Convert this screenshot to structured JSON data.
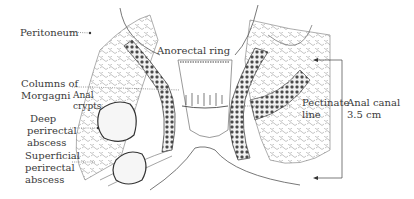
{
  "diagram": {
    "colors": {
      "ink": "#3a3a3a",
      "tissue_dark": "#4a4a4a",
      "fat_lobules": "#8a8a8a",
      "background": "#ffffff"
    },
    "labels": {
      "peritoneum": "Peritoneum",
      "anorectal_ring": "Anorectal ring",
      "columns_line1": "Columns of",
      "columns_line2": "Morgagni",
      "anal_crypts_line1": "Anal",
      "anal_crypts_line2": "crypts",
      "deep_line1": "Deep",
      "deep_line2": "perirectal",
      "deep_line3": "abscess",
      "superficial_line1": "Superficial",
      "superficial_line2": "perirectal",
      "superficial_line3": "abscess",
      "pectinate_line1": "Pectinate",
      "pectinate_line2": "line",
      "anal_canal_line1": "Anal canal",
      "anal_canal_line2": "3.5 cm"
    },
    "measurement": {
      "structure": "Anal canal",
      "length": "3.5 cm"
    }
  }
}
